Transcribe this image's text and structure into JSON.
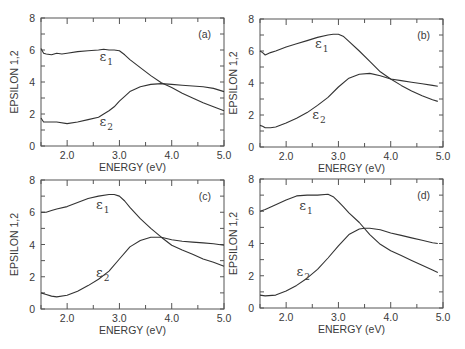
{
  "figure": {
    "panels_layout": "2x2"
  },
  "chart_data": [
    {
      "type": "line",
      "panel": "(a)",
      "xlabel": "ENERGY (eV)",
      "ylabel": "EPSILON 1,2",
      "xlim": [
        1.5,
        5.0
      ],
      "ylim": [
        0,
        8
      ],
      "xticks": [
        "2.0",
        "3.0",
        "4.0",
        "5.0"
      ],
      "yticks": [
        "0",
        "2",
        "4",
        "6",
        "8"
      ],
      "grid": false,
      "series": [
        {
          "name": "ε1",
          "x": [
            1.5,
            1.55,
            1.6,
            1.7,
            1.8,
            1.9,
            2.0,
            2.2,
            2.4,
            2.6,
            2.7,
            2.8,
            2.9,
            3.0,
            3.1,
            3.2,
            3.4,
            3.6,
            3.8,
            4.0,
            4.2,
            4.4,
            4.6,
            4.8,
            5.0
          ],
          "y": [
            6.1,
            5.8,
            5.75,
            5.7,
            5.8,
            5.75,
            5.8,
            5.9,
            5.95,
            6.0,
            6.05,
            6.0,
            6.0,
            5.95,
            5.7,
            5.4,
            4.9,
            4.4,
            3.95,
            3.65,
            3.3,
            3.0,
            2.7,
            2.45,
            2.2
          ]
        },
        {
          "name": "ε2",
          "x": [
            1.5,
            1.55,
            1.6,
            1.7,
            1.8,
            2.0,
            2.2,
            2.4,
            2.6,
            2.7,
            2.8,
            2.9,
            3.0,
            3.1,
            3.2,
            3.4,
            3.6,
            3.8,
            4.0,
            4.2,
            4.4,
            4.6,
            4.8,
            5.0
          ],
          "y": [
            1.75,
            1.5,
            1.5,
            1.5,
            1.5,
            1.4,
            1.5,
            1.65,
            1.8,
            2.0,
            2.2,
            2.45,
            2.8,
            3.1,
            3.4,
            3.7,
            3.85,
            3.9,
            3.85,
            3.8,
            3.75,
            3.7,
            3.6,
            3.4
          ]
        }
      ],
      "annotations": [
        {
          "text": "ε",
          "sub": "1",
          "x": 2.62,
          "y": 5.3
        },
        {
          "text": "ε",
          "sub": "2",
          "x": 2.62,
          "y": 1.25
        }
      ]
    },
    {
      "type": "line",
      "panel": "(b)",
      "xlabel": "ENERGY (eV)",
      "ylabel": "EPSILON 1,2",
      "xlim": [
        1.5,
        5.0
      ],
      "ylim": [
        0,
        8
      ],
      "xticks": [
        "2.0",
        "3.0",
        "4.0",
        "5.0"
      ],
      "yticks": [
        "0",
        "2",
        "4",
        "6",
        "8"
      ],
      "grid": false,
      "series": [
        {
          "name": "ε1",
          "x": [
            1.5,
            1.55,
            1.6,
            1.7,
            1.8,
            2.0,
            2.2,
            2.4,
            2.6,
            2.8,
            2.9,
            3.0,
            3.1,
            3.2,
            3.4,
            3.6,
            3.8,
            4.0,
            4.2,
            4.4,
            4.6,
            4.8,
            4.9
          ],
          "y": [
            6.0,
            5.9,
            5.75,
            5.9,
            6.0,
            6.25,
            6.45,
            6.65,
            6.85,
            7.0,
            7.05,
            7.05,
            6.9,
            6.6,
            6.0,
            5.35,
            4.7,
            4.25,
            3.85,
            3.5,
            3.2,
            2.95,
            2.85
          ]
        },
        {
          "name": "ε2",
          "x": [
            1.5,
            1.55,
            1.6,
            1.7,
            1.8,
            2.0,
            2.2,
            2.4,
            2.6,
            2.8,
            3.0,
            3.2,
            3.4,
            3.6,
            3.8,
            4.0,
            4.2,
            4.4,
            4.6,
            4.8,
            4.9
          ],
          "y": [
            1.35,
            1.3,
            1.2,
            1.2,
            1.25,
            1.5,
            1.8,
            2.15,
            2.6,
            3.1,
            3.75,
            4.3,
            4.55,
            4.6,
            4.45,
            4.25,
            4.15,
            4.05,
            3.95,
            3.85,
            3.8
          ]
        }
      ],
      "annotations": [
        {
          "text": "ε",
          "sub": "1",
          "x": 2.55,
          "y": 6.2
        },
        {
          "text": "ε",
          "sub": "2",
          "x": 2.5,
          "y": 1.75
        }
      ]
    },
    {
      "type": "line",
      "panel": "(c)",
      "xlabel": "ENERGY (eV)",
      "ylabel": "EPSILON 1,2",
      "xlim": [
        1.5,
        5.0
      ],
      "ylim": [
        0,
        8
      ],
      "xticks": [
        "2.0",
        "3.0",
        "4.0",
        "5.0"
      ],
      "yticks": [
        "0",
        "2",
        "4",
        "6",
        "8"
      ],
      "grid": false,
      "series": [
        {
          "name": "ε1",
          "x": [
            1.5,
            1.6,
            1.7,
            1.8,
            2.0,
            2.2,
            2.4,
            2.6,
            2.8,
            2.9,
            3.0,
            3.1,
            3.2,
            3.4,
            3.6,
            3.8,
            4.0,
            4.2,
            4.4,
            4.6,
            4.8,
            5.0
          ],
          "y": [
            6.0,
            6.0,
            6.1,
            6.2,
            6.35,
            6.6,
            6.85,
            7.0,
            7.1,
            7.1,
            7.0,
            6.7,
            6.3,
            5.6,
            5.0,
            4.45,
            3.95,
            3.65,
            3.4,
            3.1,
            2.9,
            2.65
          ]
        },
        {
          "name": "ε2",
          "x": [
            1.5,
            1.6,
            1.7,
            1.8,
            2.0,
            2.2,
            2.4,
            2.6,
            2.8,
            3.0,
            3.2,
            3.4,
            3.6,
            3.8,
            4.0,
            4.2,
            4.4,
            4.6,
            4.8,
            5.0
          ],
          "y": [
            1.0,
            0.9,
            0.8,
            0.75,
            0.85,
            1.1,
            1.45,
            1.85,
            2.35,
            3.1,
            3.85,
            4.25,
            4.45,
            4.45,
            4.3,
            4.2,
            4.15,
            4.1,
            4.05,
            3.95
          ]
        }
      ],
      "annotations": [
        {
          "text": "ε",
          "sub": "1",
          "x": 2.55,
          "y": 6.2
        },
        {
          "text": "ε",
          "sub": "2",
          "x": 2.55,
          "y": 2.0
        }
      ]
    },
    {
      "type": "line",
      "panel": "(d)",
      "xlabel": "ENERGY (eV)",
      "ylabel": "EPSILON 1,2",
      "xlim": [
        1.5,
        5.0
      ],
      "ylim": [
        0,
        8
      ],
      "xticks": [
        "2.0",
        "3.0",
        "4.0",
        "5.0"
      ],
      "yticks": [
        "0",
        "2",
        "4",
        "6",
        "8"
      ],
      "grid": false,
      "series": [
        {
          "name": "ε1",
          "x": [
            1.5,
            1.6,
            1.8,
            2.0,
            2.2,
            2.4,
            2.6,
            2.8,
            2.9,
            3.0,
            3.1,
            3.2,
            3.4,
            3.6,
            3.8,
            4.0,
            4.2,
            4.4,
            4.6,
            4.8,
            4.9
          ],
          "y": [
            6.0,
            6.1,
            6.4,
            6.7,
            6.95,
            7.0,
            7.0,
            7.05,
            6.9,
            6.6,
            6.25,
            5.9,
            5.3,
            4.55,
            3.95,
            3.55,
            3.25,
            2.95,
            2.65,
            2.35,
            2.2
          ]
        },
        {
          "name": "ε2",
          "x": [
            1.5,
            1.6,
            1.8,
            2.0,
            2.2,
            2.4,
            2.6,
            2.8,
            3.0,
            3.2,
            3.4,
            3.5,
            3.6,
            3.8,
            4.0,
            4.2,
            4.4,
            4.6,
            4.8,
            4.9
          ],
          "y": [
            0.8,
            0.75,
            0.8,
            1.05,
            1.4,
            1.85,
            2.4,
            3.1,
            3.85,
            4.55,
            4.9,
            4.95,
            4.95,
            4.85,
            4.65,
            4.5,
            4.35,
            4.2,
            4.05,
            4.0
          ]
        }
      ],
      "annotations": [
        {
          "text": "ε",
          "sub": "1",
          "x": 2.25,
          "y": 6.05
        },
        {
          "text": "ε",
          "sub": "2",
          "x": 2.2,
          "y": 2.0
        }
      ]
    }
  ]
}
